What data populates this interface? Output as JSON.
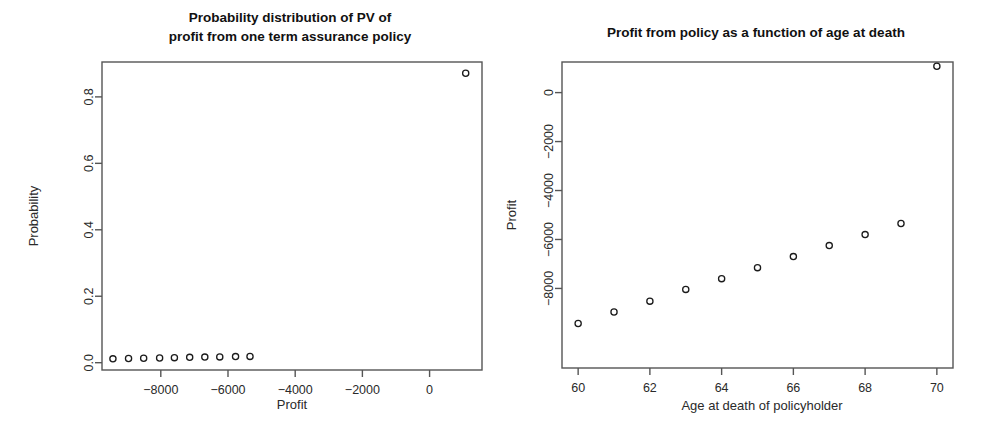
{
  "figure": {
    "background": "#ffffff",
    "foreground": "#1a1a1a",
    "point_color": "#1b1b1b",
    "axis_color": "#555555"
  },
  "chart_data": [
    {
      "id": "left",
      "type": "scatter",
      "title": "Probability distribution of PV of\nprofit from one term assurance policy",
      "title_line1": "Probability distribution of PV of",
      "title_line2": "profit from one term assurance policy",
      "xlabel": "Profit",
      "ylabel": "Probability",
      "xlim": [
        -9750,
        1560
      ],
      "ylim": [
        -0.022,
        0.905
      ],
      "xticks": [
        -8000,
        -6000,
        -4000,
        -2000,
        0
      ],
      "xticklabels": [
        "−8000",
        "−6000",
        "−4000",
        "−2000",
        "0"
      ],
      "yticks": [
        0.0,
        0.2,
        0.4,
        0.6,
        0.8
      ],
      "yticklabels": [
        "0.0",
        "0.2",
        "0.4",
        "0.6",
        "0.8"
      ],
      "grid": false,
      "legend": null,
      "marker": "open-circle",
      "x": [
        -9425,
        -8960,
        -8510,
        -8035,
        -7595,
        -7140,
        -6690,
        -6245,
        -5775,
        -5345,
        1075
      ],
      "y": [
        0.0115,
        0.0125,
        0.0133,
        0.0143,
        0.0152,
        0.016,
        0.0168,
        0.0175,
        0.0183,
        0.019,
        0.871
      ],
      "points": [
        {
          "x": -9425,
          "y": 0.0115
        },
        {
          "x": -8960,
          "y": 0.0125
        },
        {
          "x": -8510,
          "y": 0.0133
        },
        {
          "x": -8035,
          "y": 0.0143
        },
        {
          "x": -7595,
          "y": 0.0152
        },
        {
          "x": -7140,
          "y": 0.016
        },
        {
          "x": -6690,
          "y": 0.0168
        },
        {
          "x": -6245,
          "y": 0.0175
        },
        {
          "x": -5775,
          "y": 0.0183
        },
        {
          "x": -5345,
          "y": 0.019
        },
        {
          "x": 1075,
          "y": 0.871
        }
      ]
    },
    {
      "id": "right",
      "type": "scatter",
      "title": "Profit from policy as a function of age at death",
      "title_line1": "Profit from policy as a function of age at death",
      "title_line2": "",
      "xlabel": "Age at death of policyholder",
      "ylabel": "Profit",
      "xlim": [
        59.55,
        70.45
      ],
      "ylim": [
        -11250,
        1250
      ],
      "xticks": [
        60,
        62,
        64,
        66,
        68,
        70
      ],
      "xticklabels": [
        "60",
        "62",
        "64",
        "66",
        "68",
        "70"
      ],
      "yticks": [
        0,
        -2000,
        -4000,
        -6000,
        -8000
      ],
      "yticklabels": [
        "0",
        "−2000",
        "−4000",
        "−6000",
        "−8000"
      ],
      "grid": false,
      "legend": null,
      "marker": "open-circle",
      "x": [
        60,
        61,
        62,
        63,
        64,
        65,
        66,
        67,
        68,
        69,
        70
      ],
      "y": [
        -9430,
        -8960,
        -8520,
        -8040,
        -7600,
        -7150,
        -6700,
        -6250,
        -5800,
        -5350,
        1075
      ],
      "points": [
        {
          "x": 60,
          "y": -9430
        },
        {
          "x": 61,
          "y": -8960
        },
        {
          "x": 62,
          "y": -8520
        },
        {
          "x": 63,
          "y": -8040
        },
        {
          "x": 64,
          "y": -7600
        },
        {
          "x": 65,
          "y": -7150
        },
        {
          "x": 66,
          "y": -6700
        },
        {
          "x": 67,
          "y": -6250
        },
        {
          "x": 68,
          "y": -5800
        },
        {
          "x": 69,
          "y": -5350
        },
        {
          "x": 70,
          "y": 1075
        }
      ]
    }
  ]
}
